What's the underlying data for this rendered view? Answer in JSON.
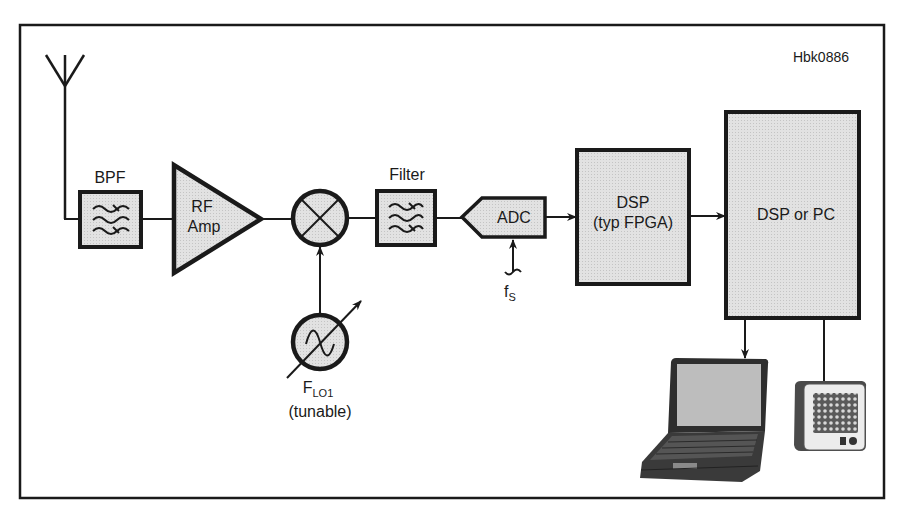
{
  "figure_id": "Hbk0886",
  "colors": {
    "stroke": "#1a1a1a",
    "block_fill": "#dcdcdc",
    "background": "#ffffff",
    "laptop_body": "#3a3a3a",
    "laptop_screen": "#bdbdbd",
    "speaker_face": "#ececec",
    "speaker_grille": "#6a6a6a"
  },
  "blocks": {
    "antenna": {
      "label": ""
    },
    "bpf": {
      "label": "BPF"
    },
    "rf_amp": {
      "line1": "RF",
      "line2": "Amp"
    },
    "mixer": {
      "label": ""
    },
    "lo": {
      "main": "F",
      "sub": "LO1",
      "note": "(tunable)"
    },
    "filter": {
      "label": "Filter"
    },
    "adc": {
      "label": "ADC",
      "clock_main": "f",
      "clock_sub": "S"
    },
    "dsp_fpga": {
      "line1": "DSP",
      "line2": "(typ FPGA)"
    },
    "dsp_pc": {
      "label": "DSP or PC"
    },
    "laptop": {
      "label": ""
    },
    "speaker": {
      "label": ""
    }
  },
  "connections": [
    {
      "from": "antenna",
      "to": "bpf"
    },
    {
      "from": "bpf",
      "to": "rf_amp"
    },
    {
      "from": "rf_amp",
      "to": "mixer"
    },
    {
      "from": "lo",
      "to": "mixer",
      "arrow": true
    },
    {
      "from": "mixer",
      "to": "filter"
    },
    {
      "from": "filter",
      "to": "adc"
    },
    {
      "from": "fs_clock",
      "to": "adc",
      "arrow": true
    },
    {
      "from": "adc",
      "to": "dsp_fpga",
      "arrow": true
    },
    {
      "from": "dsp_fpga",
      "to": "dsp_pc",
      "arrow": true
    },
    {
      "from": "dsp_pc",
      "to": "laptop",
      "arrow": true
    },
    {
      "from": "dsp_pc",
      "to": "speaker",
      "arrow": false
    }
  ]
}
